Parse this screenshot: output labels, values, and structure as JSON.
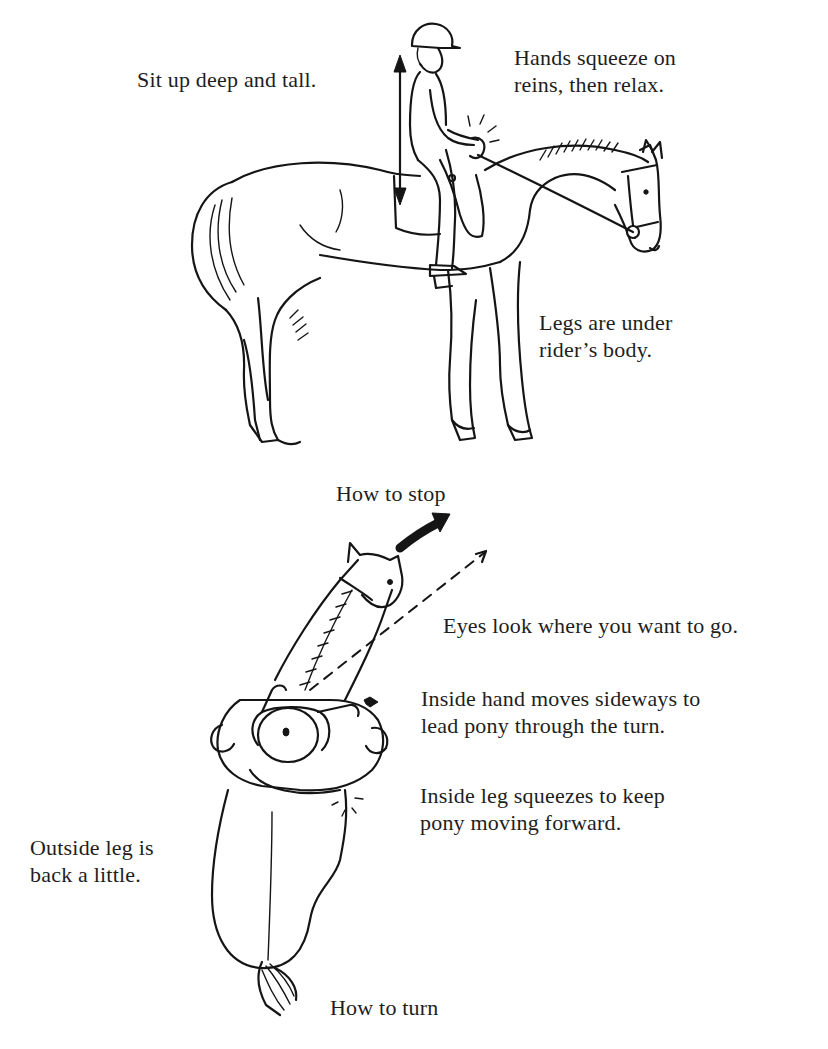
{
  "figure_top": {
    "title": "How to stop",
    "labels": {
      "sit_up": "Sit up deep and tall.",
      "hands": [
        "Hands squeeze on",
        "reins, then relax."
      ],
      "legs": [
        "Legs are under",
        "rider’s body."
      ]
    },
    "icons": {
      "posture_arrow": "double-headed-vertical-arrow",
      "squeeze_marks": "impact-lines"
    }
  },
  "figure_bottom": {
    "title": "How to turn",
    "labels": {
      "eyes": "Eyes look where you want to go.",
      "inside_hand": [
        "Inside hand moves sideways to",
        "lead pony through the turn."
      ],
      "inside_leg": [
        "Inside leg squeezes to keep",
        "pony moving forward."
      ],
      "outside_leg": [
        "Outside leg is",
        "back a little."
      ]
    },
    "icons": {
      "turn_arrow": "curved-bold-arrow",
      "eye_line": "dashed-arrow",
      "hand_arrow": "small-bold-arrow",
      "squeeze_marks": "impact-lines"
    }
  },
  "colors": {
    "ink": "#151515",
    "background": "#ffffff",
    "text": "#1e1e1e"
  }
}
